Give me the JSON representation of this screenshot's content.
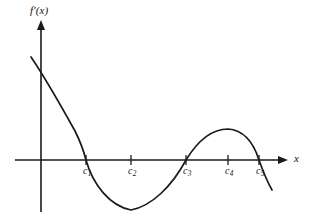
{
  "figure": {
    "kind": "cartesian-graph",
    "background_color": "#ffffff",
    "ink_color": "#1a1a1a"
  },
  "axes": {
    "y_axis": {
      "label": "f′(x)",
      "name": "y-axis",
      "x_px": 41,
      "top_px": 20,
      "bottom_px": 212,
      "arrow": "up-arrowhead"
    },
    "x_axis": {
      "label": "x",
      "name": "x-axis",
      "y_px": 160,
      "left_px": 15,
      "right_px": 288,
      "arrow": "right-arrowhead"
    }
  },
  "ticks": [
    {
      "label_text": "c",
      "subscript": "1",
      "x_px": 86,
      "name": "tick-c1",
      "zero_crossing": true
    },
    {
      "label_text": "c",
      "subscript": "2",
      "x_px": 131,
      "name": "tick-c2",
      "zero_crossing": false
    },
    {
      "label_text": "c",
      "subscript": "3",
      "x_px": 186,
      "name": "tick-c3",
      "zero_crossing": true
    },
    {
      "label_text": "c",
      "subscript": "4",
      "x_px": 228,
      "name": "tick-c4",
      "zero_crossing": false
    },
    {
      "label_text": "c",
      "subscript": "5",
      "x_px": 259,
      "name": "tick-c5",
      "zero_crossing": true
    }
  ],
  "chart_data": {
    "type": "line",
    "title": "",
    "subtitle": "",
    "xlabel": "x",
    "ylabel": "f′(x)",
    "legend": [],
    "grid": false,
    "axis_ranges": {
      "x_px": [
        15,
        288
      ],
      "y_px": [
        20,
        212
      ],
      "x_axis_y_px": 160,
      "y_axis_x_px": 41
    },
    "tick_labels": [
      "c₁",
      "c₂",
      "c₃",
      "c₄",
      "c₅"
    ],
    "tick_positions_px": [
      86,
      131,
      186,
      228,
      259
    ],
    "zero_crossings_px": [
      86,
      186,
      259
    ],
    "critical_points": {
      "local_minimum_px": [
        131,
        210
      ],
      "local_maximum_px": [
        228,
        130
      ]
    },
    "curve_endpoints_px": {
      "start": [
        31,
        57
      ],
      "end": [
        272,
        190
      ]
    },
    "y_intercept_px": [
      41,
      72
    ],
    "series": [
      {
        "name": "f'(x)",
        "points_px": [
          [
            31,
            57
          ],
          [
            41,
            72
          ],
          [
            52,
            89
          ],
          [
            64,
            108
          ],
          [
            75,
            128
          ],
          [
            86,
            160
          ],
          [
            97,
            181
          ],
          [
            108,
            196
          ],
          [
            120,
            206
          ],
          [
            131,
            210
          ],
          [
            143,
            207
          ],
          [
            154,
            199
          ],
          [
            165,
            186
          ],
          [
            176,
            172
          ],
          [
            186,
            160
          ],
          [
            197,
            146
          ],
          [
            208,
            136
          ],
          [
            218,
            130
          ],
          [
            228,
            129
          ],
          [
            238,
            133
          ],
          [
            248,
            143
          ],
          [
            259,
            160
          ],
          [
            266,
            175
          ],
          [
            272,
            190
          ]
        ],
        "path_d": "M 31 57 C 44 76 60 104 75 131 C 82 145 84 152 86 160 C 93 185 110 206 131 210 C 152 206 172 186 186 160 C 197 142 211 129 228 129 C 243 130 253 141 259 160 C 264 174 268 183 272 190"
      }
    ],
    "annotations": []
  }
}
